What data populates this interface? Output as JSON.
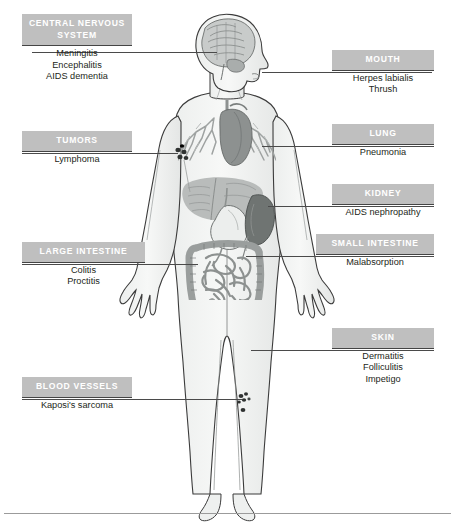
{
  "diagram": {
    "figure_description": "Anterior view of a human body with head in right profile, showing brain, lungs, heart, liver, stomach, kidney, large and small intestine, axillary lymph nodes and skin lesions",
    "colors": {
      "header_bar": "#bfbfbf",
      "header_text": "#ffffff",
      "body_text": "#231f20",
      "leader_line": "#4a4a4a",
      "organ_light": "#d8dad9",
      "organ_mid": "#a9adac",
      "organ_dark": "#6f7472",
      "body_fill": "#f2f3f2",
      "outline": "#3b3b3b",
      "bottom_rule": "#9b9b9b"
    }
  },
  "callouts": [
    {
      "id": "central-nervous-system",
      "heading": "CENTRAL NERVOUS\nSYSTEM",
      "conditions": "Meningitis\nEncephalitis\nAIDS dementia",
      "side": "left"
    },
    {
      "id": "tumors",
      "heading": "TUMORS",
      "conditions": "Lymphoma",
      "side": "left"
    },
    {
      "id": "large-intestine",
      "heading": "LARGE INTESTINE",
      "conditions": "Colitis\nProctitis",
      "side": "left"
    },
    {
      "id": "blood-vessels",
      "heading": "BLOOD VESSELS",
      "conditions": "Kaposi's sarcoma",
      "side": "left"
    },
    {
      "id": "mouth",
      "heading": "MOUTH",
      "conditions": "Herpes labialis\nThrush",
      "side": "right"
    },
    {
      "id": "lung",
      "heading": "LUNG",
      "conditions": "Pneumonia",
      "side": "right"
    },
    {
      "id": "kidney",
      "heading": "KIDNEY",
      "conditions": "AIDS nephropathy",
      "side": "right"
    },
    {
      "id": "small-intestine",
      "heading": "SMALL INTESTINE",
      "conditions": "Malabsorption",
      "side": "right"
    },
    {
      "id": "skin",
      "heading": "SKIN",
      "conditions": "Dermatitis\nFolliculitis\nImpetigo",
      "side": "right"
    }
  ]
}
